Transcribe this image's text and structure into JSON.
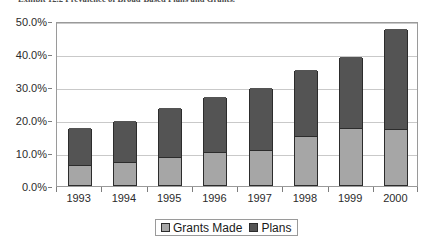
{
  "caption": "Exhibit 12.2   Prevalence of Broad-Based Plans and Grants.",
  "legend": {
    "items": [
      {
        "label": "Grants Made",
        "color": "#a6a6a6",
        "swatch_name": "legend-swatch-grants-made"
      },
      {
        "label": "Plans",
        "color": "#545454",
        "swatch_name": "legend-swatch-plans"
      }
    ]
  },
  "axis": {
    "y_ticks": [
      "0.0%",
      "10.0%",
      "20.0%",
      "30.0%",
      "40.0%",
      "50.0%"
    ],
    "x_ticks": [
      "1993",
      "1994",
      "1995",
      "1996",
      "1997",
      "1998",
      "1999",
      "2000"
    ]
  },
  "chart_data": {
    "type": "bar",
    "stacked": true,
    "title": "Prevalence of Broad-Based Plans and Grants",
    "xlabel": "",
    "ylabel": "",
    "ylim": [
      0,
      50
    ],
    "ytick_values": [
      0,
      10,
      20,
      30,
      40,
      50
    ],
    "ytick_labels": [
      "0.0%",
      "10.0%",
      "20.0%",
      "30.0%",
      "40.0%",
      "50.0%"
    ],
    "grid": true,
    "grid_axis": "y",
    "legend_position": "bottom",
    "units": "percent",
    "categories": [
      "1993",
      "1994",
      "1995",
      "1996",
      "1997",
      "1998",
      "1999",
      "2000"
    ],
    "series": [
      {
        "name": "Grants Made",
        "color": "#a6a6a6",
        "values": [
          6.0,
          7.0,
          8.5,
          10.0,
          10.6,
          15.0,
          17.3,
          17.0
        ]
      },
      {
        "name": "Plans",
        "color": "#545454",
        "values": [
          11.3,
          12.4,
          14.8,
          16.7,
          18.8,
          19.8,
          21.5,
          30.3
        ]
      }
    ],
    "totals": [
      17.3,
      19.4,
      23.3,
      26.7,
      29.4,
      34.8,
      38.8,
      47.3
    ]
  }
}
